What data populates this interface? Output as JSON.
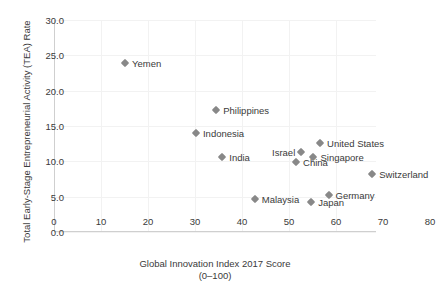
{
  "chart_data": {
    "type": "scatter",
    "title": "",
    "xlabel": "Global Innovation Index 2017 Score",
    "xlabel_sub": "(0–100)",
    "ylabel": "Total Early-Stage Entrepreneurial Activity (TEA) Rate",
    "xlim": [
      0,
      68.5
    ],
    "ylim": [
      0,
      30
    ],
    "xticks": [
      0,
      10,
      20,
      30,
      40,
      50,
      60,
      70,
      80
    ],
    "xtick_labels": [
      "0",
      "10",
      "20",
      "30",
      "40",
      "50",
      "60",
      "70",
      "80"
    ],
    "yticks": [
      0,
      5,
      10,
      15,
      20,
      25,
      30
    ],
    "ytick_labels": [
      "0.0",
      "5.0",
      "10.0",
      "15.0",
      "20.0",
      "25.0",
      "30.0"
    ],
    "grid": true,
    "legend": "none",
    "marker": "diamond",
    "marker_color": "#888888",
    "points": [
      {
        "label": "Yemen",
        "x": 15.1,
        "y": 23.9,
        "label_side": "right"
      },
      {
        "label": "Philippines",
        "x": 34.5,
        "y": 17.2,
        "label_side": "right"
      },
      {
        "label": "Indonesia",
        "x": 30.2,
        "y": 14.0,
        "label_side": "right"
      },
      {
        "label": "India",
        "x": 35.8,
        "y": 10.6,
        "label_side": "right"
      },
      {
        "label": "Israel",
        "x": 52.6,
        "y": 11.3,
        "label_side": "left"
      },
      {
        "label": "China",
        "x": 51.5,
        "y": 9.9,
        "label_side": "right"
      },
      {
        "label": "Singapore",
        "x": 55.2,
        "y": 10.6,
        "label_side": "right"
      },
      {
        "label": "United States",
        "x": 56.6,
        "y": 12.6,
        "label_side": "right"
      },
      {
        "label": "Switzerland",
        "x": 67.7,
        "y": 8.2,
        "label_side": "right"
      },
      {
        "label": "Malaysia",
        "x": 42.7,
        "y": 4.7,
        "label_side": "right"
      },
      {
        "label": "Japan",
        "x": 54.7,
        "y": 4.2,
        "label_side": "right"
      },
      {
        "label": "Germany",
        "x": 58.4,
        "y": 5.3,
        "label_side": "right"
      }
    ]
  }
}
